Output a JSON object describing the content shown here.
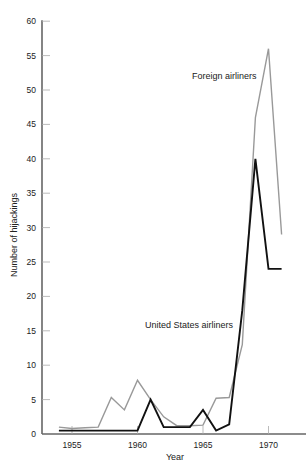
{
  "chart_data": {
    "type": "line",
    "title": "",
    "xlabel": "Year",
    "ylabel": "Number of hijackings",
    "xlim": [
      1953,
      1972
    ],
    "ylim": [
      0,
      60
    ],
    "grid": false,
    "legend_position": "inline labels",
    "x_ticks": [
      1955,
      1960,
      1965,
      1970
    ],
    "y_ticks": [
      0,
      5,
      10,
      15,
      20,
      25,
      30,
      35,
      40,
      45,
      50,
      55,
      60
    ],
    "x": [
      1954,
      1955,
      1956,
      1957,
      1958,
      1959,
      1960,
      1961,
      1962,
      1963,
      1964,
      1965,
      1966,
      1967,
      1968,
      1969,
      1970,
      1971
    ],
    "series": [
      {
        "name": "Foreign airliners",
        "color": "#999999",
        "values": [
          1,
          0.8,
          0.9,
          1,
          5.3,
          3.5,
          7.8,
          5,
          2.5,
          1.2,
          1.2,
          1.3,
          5.2,
          5.3,
          13,
          46,
          56,
          29
        ]
      },
      {
        "name": "United States airliners",
        "color": "#111111",
        "values": [
          0.5,
          0.5,
          0.5,
          0.5,
          0.5,
          0.5,
          0.5,
          5,
          1,
          1,
          1,
          3.5,
          0.5,
          1.4,
          18,
          40,
          24,
          24
        ]
      }
    ],
    "annotations": [
      {
        "text": "Foreign airliners",
        "x": 1966.2,
        "y": 52
      },
      {
        "text": "United States airliners",
        "x": 1961.5,
        "y": 16
      }
    ]
  },
  "labels": {
    "xlabel": "Year",
    "ylabel": "Number of hijackings",
    "foreign": "Foreign airliners",
    "us": "United States airliners"
  }
}
